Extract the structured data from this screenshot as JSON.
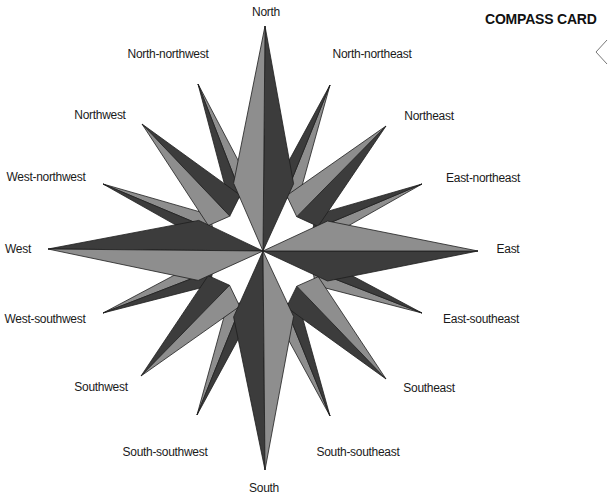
{
  "title": "COMPASS CARD",
  "center": {
    "x": 263,
    "y": 251
  },
  "colors": {
    "dark": "#3c3c3c",
    "light": "#8e8e8e",
    "mid": "#5a5a5a",
    "outline": "#1e1e1e",
    "text": "#1a1a1a"
  },
  "points": [
    {
      "name": "North",
      "tip": [
        265,
        26
      ],
      "half": 30,
      "tier": "main",
      "label_pos": [
        266,
        5
      ]
    },
    {
      "name": "North-northeast",
      "tip": [
        330,
        85
      ],
      "half": 13,
      "tier": "minor",
      "label_pos": [
        372,
        47
      ]
    },
    {
      "name": "Northeast",
      "tip": [
        386,
        126
      ],
      "half": 22,
      "tier": "inter",
      "label_pos": [
        429,
        109
      ]
    },
    {
      "name": "East-northeast",
      "tip": [
        422,
        184
      ],
      "half": 13,
      "tier": "minor",
      "label_pos": [
        483,
        171
      ]
    },
    {
      "name": "East",
      "tip": [
        478,
        251
      ],
      "half": 30,
      "tier": "main",
      "label_pos": [
        508,
        242
      ]
    },
    {
      "name": "East-southeast",
      "tip": [
        422,
        313
      ],
      "half": 13,
      "tier": "minor",
      "label_pos": [
        481,
        312
      ]
    },
    {
      "name": "Southeast",
      "tip": [
        386,
        379
      ],
      "half": 22,
      "tier": "inter",
      "label_pos": [
        429,
        381
      ]
    },
    {
      "name": "South-southeast",
      "tip": [
        330,
        416
      ],
      "half": 13,
      "tier": "minor",
      "label_pos": [
        358,
        445
      ]
    },
    {
      "name": "South",
      "tip": [
        265,
        470
      ],
      "half": 30,
      "tier": "main",
      "label_pos": [
        264,
        481
      ]
    },
    {
      "name": "South-southwest",
      "tip": [
        197,
        415
      ],
      "half": 13,
      "tier": "minor",
      "label_pos": [
        165,
        445
      ]
    },
    {
      "name": "Southwest",
      "tip": [
        141,
        376
      ],
      "half": 22,
      "tier": "inter",
      "label_pos": [
        101,
        380
      ]
    },
    {
      "name": "West-southwest",
      "tip": [
        103,
        313
      ],
      "half": 13,
      "tier": "minor",
      "label_pos": [
        45,
        312
      ]
    },
    {
      "name": "West",
      "tip": [
        48,
        249
      ],
      "half": 30,
      "tier": "main",
      "label_pos": [
        18,
        242
      ]
    },
    {
      "name": "West-northwest",
      "tip": [
        103,
        184
      ],
      "half": 13,
      "tier": "minor",
      "label_pos": [
        46,
        170
      ]
    },
    {
      "name": "Northwest",
      "tip": [
        142,
        124
      ],
      "half": 22,
      "tier": "inter",
      "label_pos": [
        100,
        108
      ]
    },
    {
      "name": "North-northwest",
      "tip": [
        198,
        84
      ],
      "half": 13,
      "tier": "minor",
      "label_pos": [
        168,
        47
      ]
    }
  ],
  "nav": {
    "prev_label": "previous"
  }
}
